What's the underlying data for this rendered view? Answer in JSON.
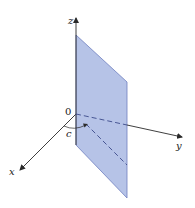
{
  "figure": {
    "labels": {
      "origin": "0",
      "x_axis": "x",
      "y_axis": "y",
      "z_axis": "z",
      "distance": "c"
    },
    "colors": {
      "plane_fill": "#a9b8e3",
      "plane_edge": "#6f7fbf",
      "axis": "#2a2a2a",
      "dashed_line": "#3b4a8a"
    }
  }
}
